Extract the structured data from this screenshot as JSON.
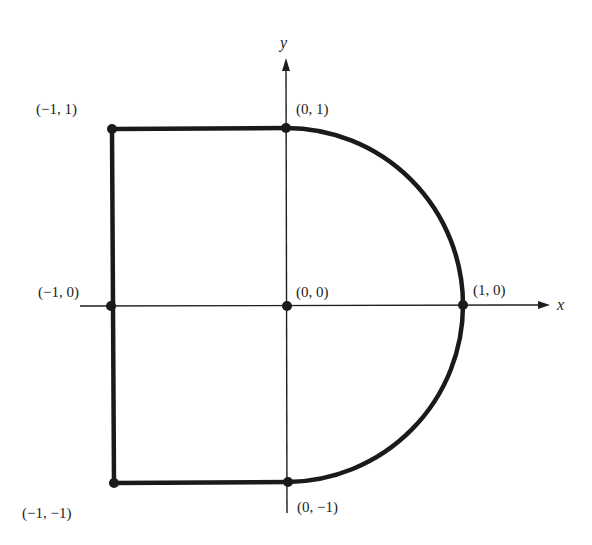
{
  "figure": {
    "type": "region-boundary-diagram",
    "axes": {
      "x_label": "x",
      "y_label": "y"
    },
    "points": [
      {
        "id": "p_m1_1",
        "label": "(−1, 1)"
      },
      {
        "id": "p_0_1",
        "label": "(0, 1)"
      },
      {
        "id": "p_m1_0",
        "label": "(−1, 0)"
      },
      {
        "id": "p_0_0",
        "label": "(0, 0)"
      },
      {
        "id": "p_1_0",
        "label": "(1, 0)"
      },
      {
        "id": "p_m1_m1",
        "label": "(−1, −1)"
      },
      {
        "id": "p_0_m1",
        "label": "(0, −1)"
      }
    ],
    "boundary": {
      "description": "Rectangle from x=-1 to x=0, y=-1 to 1, joined with right half-disk of radius 1 centered at origin",
      "segments": [
        "(-1,-1) to (-1,1)",
        "(-1,1) to (0,1)",
        "arc (0,1) to (1,0) to (0,-1)",
        "(0,-1) to (-1,-1)"
      ]
    },
    "colors": {
      "ink": "#1a1a1a",
      "background": "#ffffff"
    }
  }
}
